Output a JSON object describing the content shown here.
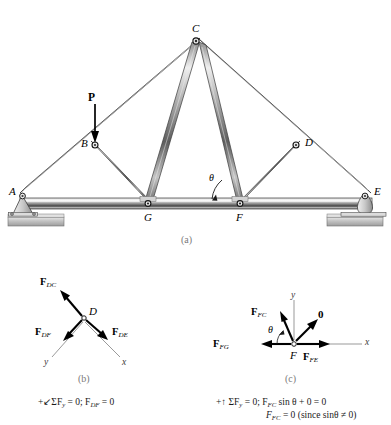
{
  "figure": {
    "title_caption_a": "(a)",
    "title_caption_b": "(b)",
    "title_caption_c": "(c)"
  },
  "truss": {
    "joints": [
      {
        "id": "A",
        "label": "A",
        "x": 22,
        "y": 196,
        "type": "pin-support"
      },
      {
        "id": "B",
        "label": "B",
        "x": 95,
        "y": 145,
        "type": "joint"
      },
      {
        "id": "C",
        "label": "C",
        "x": 196,
        "y": 40,
        "type": "apex-joint"
      },
      {
        "id": "D",
        "label": "D",
        "x": 296,
        "y": 145,
        "type": "joint"
      },
      {
        "id": "E",
        "label": "E",
        "x": 368,
        "y": 196,
        "type": "rocker-support"
      },
      {
        "id": "F",
        "label": "F",
        "x": 240,
        "y": 206,
        "type": "joint"
      },
      {
        "id": "G",
        "label": "G",
        "x": 148,
        "y": 206,
        "type": "joint"
      }
    ],
    "angle_label": "θ",
    "load_label": "P",
    "members": [
      "A-C top chord left",
      "C-E top chord right",
      "A-E bottom chord",
      "B-G",
      "C-G",
      "C-F",
      "D-F",
      "B-C",
      "C-D"
    ]
  },
  "fbd_b": {
    "joint_label": "D",
    "forces": [
      {
        "name": "F_DC",
        "base": "F",
        "sub": "DC",
        "dir": "up-left"
      },
      {
        "name": "F_DF",
        "base": "F",
        "sub": "DF",
        "dir": "down-left"
      },
      {
        "name": "F_DE",
        "base": "F",
        "sub": "DE",
        "dir": "down-right"
      }
    ],
    "axes": [
      {
        "label": "y",
        "dir": "down-left"
      },
      {
        "label": "x",
        "dir": "down-right"
      }
    ],
    "equation_line1": "ΣF",
    "equation_sub": "y",
    "equation_rest": " = 0;  F",
    "equation_sub2": "DF",
    "equation_tail": " = 0",
    "equation_prefix": "+"
  },
  "fbd_c": {
    "joint_label": "F",
    "angle_label": "θ",
    "zero_force_label": "0",
    "forces": [
      {
        "name": "F_FC",
        "base": "F",
        "sub": "FC",
        "dir": "up-left"
      },
      {
        "name": "F_FG",
        "base": "F",
        "sub": "FG",
        "dir": "left"
      },
      {
        "name": "F_FE",
        "base": "F",
        "sub": "FE",
        "dir": "right"
      }
    ],
    "axes": [
      {
        "label": "y",
        "dir": "up"
      },
      {
        "label": "x",
        "dir": "right"
      }
    ],
    "equation_line1_prefix": "+↑  ",
    "equation_line1_a": "ΣF",
    "equation_line1_sub": "y",
    "equation_line1_b": " = 0;  F",
    "equation_line1_sub2": "FC",
    "equation_line1_c": " sin θ + 0 = 0",
    "equation_line2_a": "F",
    "equation_line2_sub": "FC",
    "equation_line2_b": " = 0 (since sinθ ≠ 0)"
  },
  "colors": {
    "member_light": "#f2f2f2",
    "member_mid": "#b4b4b4",
    "member_dark": "#4a4a4a",
    "ground": "#c9c9c9",
    "outline": "#2b2b2b",
    "caption": "#7a7a7a"
  }
}
